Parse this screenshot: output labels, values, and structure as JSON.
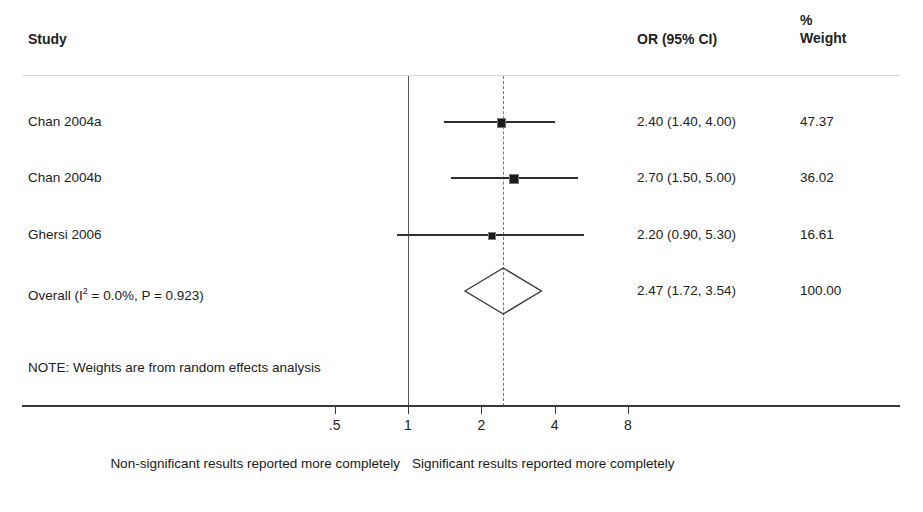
{
  "header": {
    "study_label": "Study",
    "or_label": "OR (95% CI)",
    "pct_label": "%",
    "weight_label": "Weight"
  },
  "note": "NOTE: Weights are from random effects analysis",
  "footer": {
    "left": "Non-significant results reported more completely",
    "right": "Significant results reported more completely"
  },
  "chart_data": {
    "type": "forest",
    "title": "",
    "xlabel": "",
    "ylabel": "",
    "scale": "log",
    "xlim": [
      0.4,
      10
    ],
    "null_value": 1,
    "pooled_value": 2.47,
    "grid": false,
    "axis_ticks": [
      ".5",
      "1",
      "2",
      "4",
      "8"
    ],
    "axis_tick_values": [
      0.5,
      1,
      2,
      4,
      8
    ],
    "columns": [
      "Study",
      "OR (95% CI)",
      "% Weight"
    ],
    "rows": [
      {
        "study": "Chan 2004a",
        "or": 2.4,
        "ci_low": 1.4,
        "ci_high": 4.0,
        "or_text": "2.40 (1.40, 4.00)",
        "weight": 47.37,
        "weight_text": "47.37",
        "is_summary": false
      },
      {
        "study": "Chan 2004b",
        "or": 2.7,
        "ci_low": 1.5,
        "ci_high": 5.0,
        "or_text": "2.70 (1.50, 5.00)",
        "weight": 36.02,
        "weight_text": "36.02",
        "is_summary": false
      },
      {
        "study": "Ghersi 2006",
        "or": 2.2,
        "ci_low": 0.9,
        "ci_high": 5.3,
        "or_text": "2.20 (0.90, 5.30)",
        "weight": 16.61,
        "weight_text": "16.61",
        "is_summary": false
      },
      {
        "study": "Overall (I2 = 0.0%, P = 0.923)",
        "study_prefix": "Overall (I",
        "study_sup": "2",
        "study_suffix": " = 0.0%, P = 0.923)",
        "or": 2.47,
        "ci_low": 1.72,
        "ci_high": 3.54,
        "or_text": "2.47 (1.72, 3.54)",
        "weight": 100.0,
        "weight_text": "100.00",
        "is_summary": true
      }
    ],
    "heterogeneity": {
      "i_squared": "0.0%",
      "p_value": "0.923"
    }
  },
  "colors": {
    "line": "#2e2e2e",
    "rule": "#d8d8d8",
    "null_line": "#5a5a5a",
    "pooled_line": "#777777",
    "text": "#222222"
  }
}
